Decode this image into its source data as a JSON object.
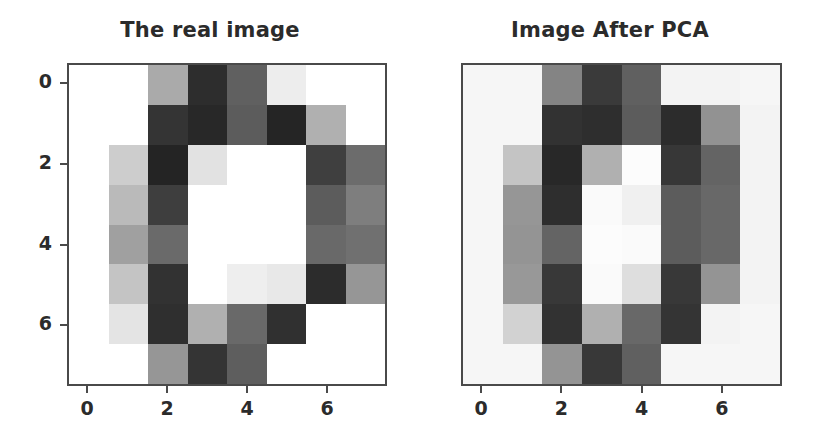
{
  "figure": {
    "width": 814,
    "height": 444,
    "background": "#ffffff",
    "axis_color": "#4a4a4a",
    "text_color": "#2b2b2b"
  },
  "panels": [
    {
      "id": "real-image",
      "title": "The real image",
      "show_yticks": true,
      "background": "#ffffff"
    },
    {
      "id": "pca-image",
      "title": "Image After PCA",
      "show_yticks": false,
      "background": "#f6f5f2"
    }
  ],
  "axis": {
    "xticks": [
      0,
      2,
      4,
      6
    ],
    "yticks": [
      0,
      2,
      4,
      6
    ],
    "xtick_labels": [
      "0",
      "2",
      "4",
      "6"
    ],
    "ytick_labels": [
      "0",
      "2",
      "4",
      "6"
    ],
    "xlim": [
      -0.5,
      7.5
    ],
    "ylim": [
      7.5,
      -0.5
    ],
    "grid": false
  },
  "chart_data": [
    {
      "type": "heatmap",
      "title": "The real image",
      "xlabel": "",
      "ylabel": "",
      "colormap": "gray",
      "vmin": 0,
      "vmax": 255,
      "rows": 8,
      "cols": 8,
      "x": [
        0,
        1,
        2,
        3,
        4,
        5,
        6,
        7
      ],
      "y": [
        0,
        1,
        2,
        3,
        4,
        5,
        6,
        7
      ],
      "values": [
        [
          255,
          255,
          170,
          45,
          96,
          237,
          255,
          255
        ],
        [
          255,
          255,
          52,
          40,
          92,
          37,
          176,
          255
        ],
        [
          255,
          205,
          36,
          226,
          255,
          255,
          63,
          108
        ],
        [
          255,
          186,
          62,
          255,
          255,
          255,
          92,
          126
        ],
        [
          255,
          160,
          106,
          255,
          255,
          255,
          105,
          112
        ],
        [
          255,
          196,
          50,
          255,
          238,
          232,
          44,
          150
        ],
        [
          255,
          228,
          47,
          176,
          105,
          48,
          255,
          255
        ],
        [
          255,
          255,
          150,
          52,
          94,
          255,
          255,
          255
        ]
      ]
    },
    {
      "type": "heatmap",
      "title": "Image After PCA",
      "xlabel": "",
      "ylabel": "",
      "colormap": "gray",
      "vmin": 0,
      "vmax": 255,
      "rows": 8,
      "cols": 8,
      "x": [
        0,
        1,
        2,
        3,
        4,
        5,
        6,
        7
      ],
      "y": [
        0,
        1,
        2,
        3,
        4,
        5,
        6,
        7
      ],
      "values": [
        [
          246,
          246,
          132,
          58,
          96,
          243,
          243,
          246
        ],
        [
          246,
          246,
          50,
          46,
          92,
          44,
          146,
          243
        ],
        [
          246,
          196,
          40,
          176,
          252,
          55,
          100,
          243
        ],
        [
          246,
          150,
          46,
          250,
          240,
          92,
          104,
          243
        ],
        [
          246,
          148,
          100,
          252,
          250,
          92,
          104,
          243
        ],
        [
          246,
          152,
          56,
          250,
          222,
          56,
          148,
          243
        ],
        [
          246,
          210,
          50,
          176,
          104,
          52,
          243,
          246
        ],
        [
          246,
          246,
          148,
          56,
          96,
          246,
          246,
          246
        ]
      ]
    }
  ]
}
